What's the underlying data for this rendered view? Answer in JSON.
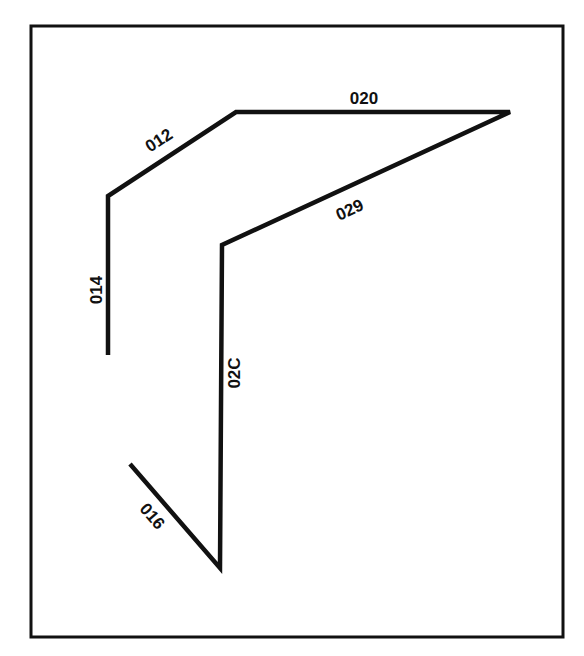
{
  "diagram": {
    "colors": {
      "background": "#ffffff",
      "stroke": "#111111"
    },
    "frame": {
      "x": 31,
      "y": 26,
      "width": 532,
      "height": 611
    },
    "segments": [
      {
        "id": "014",
        "label": "014",
        "from": [
          108,
          355
        ],
        "to": [
          108,
          196
        ]
      },
      {
        "id": "012",
        "label": "012",
        "from": [
          108,
          196
        ],
        "to": [
          236,
          112
        ]
      },
      {
        "id": "020",
        "label": "020",
        "from": [
          236,
          112
        ],
        "to": [
          510,
          112
        ]
      },
      {
        "id": "029",
        "label": "029",
        "from": [
          510,
          112
        ],
        "to": [
          222,
          245
        ]
      },
      {
        "id": "02C",
        "label": "02C",
        "from": [
          222,
          245
        ],
        "to": [
          220,
          568
        ]
      },
      {
        "id": "016",
        "label": "016",
        "from": [
          220,
          568
        ],
        "to": [
          130,
          464
        ]
      }
    ],
    "labels": {
      "s014": "014",
      "s012": "012",
      "s020": "020",
      "s029": "029",
      "s02C": "02C",
      "s016": "016"
    }
  }
}
